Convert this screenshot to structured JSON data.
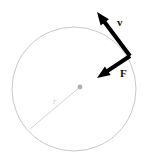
{
  "figure": {
    "background_color": "#ffffff",
    "width": 153,
    "height": 162
  },
  "circle": {
    "name": "circular-path",
    "center_x": 74,
    "center_y": 89,
    "radius": 62,
    "stroke_color": "#c9c9c9",
    "stroke_width": 1,
    "fill": "none"
  },
  "center_point": {
    "name": "circle-center-dot",
    "x": 80,
    "y": 87,
    "radius": 2.4,
    "color": "#b0b0b0"
  },
  "radius_line": {
    "name": "radius-segment",
    "x1": 80,
    "y1": 87,
    "x2": 30,
    "y2": 129,
    "stroke_color": "#d5d5d5",
    "stroke_width": 1,
    "label": "r",
    "label_x": 53,
    "label_y": 104,
    "label_color": "#c9c9c9",
    "label_size": 8
  },
  "particle_point": {
    "name": "particle-on-circle",
    "x": 130,
    "y": 56
  },
  "vectors": [
    {
      "name": "velocity-vector",
      "label": "v",
      "tail_x": 130,
      "tail_y": 56,
      "tip_x": 97,
      "tip_y": 12,
      "color": "#000000",
      "stroke_width": 4,
      "label_x": 117,
      "label_y": 26,
      "label_size": 11,
      "description": "tangent to circle, pointing up-left"
    },
    {
      "name": "force-vector",
      "label": "F",
      "tail_x": 130,
      "tail_y": 56,
      "tip_x": 97,
      "tip_y": 78,
      "color": "#000000",
      "stroke_width": 4,
      "label_x": 120,
      "label_y": 77,
      "label_size": 11,
      "description": "centripetal force, pointing down-left toward center"
    }
  ],
  "colors": {
    "vector_black": "#000000",
    "circle_gray": "#c9c9c9",
    "radius_gray": "#d5d5d5",
    "center_dot_gray": "#b0b0b0"
  }
}
